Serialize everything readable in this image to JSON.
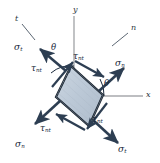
{
  "figure": {
    "colors": {
      "element_fill": "#b9c6d4",
      "element_fill_light": "#cdd7e2",
      "element_edge": "#16202c",
      "arrow": "#2d3e52",
      "axis": "#a7a9ac",
      "text": "#1b2a3d"
    }
  },
  "axes": [
    {
      "name": "y-axis",
      "label": "y",
      "symbol": "y",
      "subscript": ""
    },
    {
      "name": "x-axis",
      "label": "x",
      "symbol": "x",
      "subscript": ""
    },
    {
      "name": "n-axis",
      "label": "n",
      "symbol": "n",
      "subscript": ""
    },
    {
      "name": "t-axis",
      "label": "t",
      "symbol": "t",
      "subscript": ""
    }
  ],
  "angles": [
    {
      "name": "theta-from-y-axis",
      "label": "θ"
    },
    {
      "name": "theta-from-x-axis",
      "label": "θ"
    }
  ],
  "stress_labels": [
    {
      "name": "sigma-t-upper-left",
      "symbol": "σ",
      "subscript": "t",
      "position": "upper-left"
    },
    {
      "name": "tau-nt-upper-left",
      "symbol": "τ",
      "subscript": "nt",
      "position": "left-upper-face"
    },
    {
      "name": "tau-nt-upper-right",
      "symbol": "τ",
      "subscript": "nt",
      "position": "top-face"
    },
    {
      "name": "sigma-n-right",
      "symbol": "σ",
      "subscript": "n",
      "position": "upper-right"
    },
    {
      "name": "tau-nt-lower-left",
      "symbol": "τ",
      "subscript": "nt",
      "position": "bottom-left-face"
    },
    {
      "name": "sigma-n-lower-left",
      "symbol": "σ",
      "subscript": "n",
      "position": "lower-left"
    },
    {
      "name": "tau-nt-lower-right",
      "symbol": "τ",
      "subscript": "nt",
      "position": "right-lower-face"
    },
    {
      "name": "sigma-t-lower-right",
      "symbol": "σ",
      "subscript": "t",
      "position": "lower-right"
    }
  ]
}
